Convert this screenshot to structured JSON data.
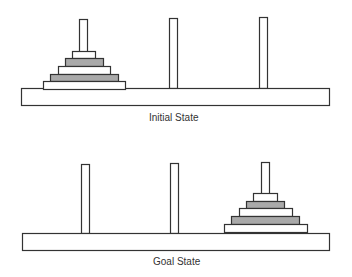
{
  "diagram": {
    "colors": {
      "stroke": "#333333",
      "disk_white": "#ffffff",
      "disk_gray": "#a9a9a9",
      "background": "#ffffff"
    },
    "panels": [
      {
        "caption": "Initial State",
        "base": {
          "x": 21,
          "y": 88,
          "w": 308,
          "h": 17
        },
        "pegs": [
          {
            "x": 79,
            "top": 19
          },
          {
            "x": 169,
            "top": 18
          },
          {
            "x": 259,
            "top": 17
          }
        ],
        "disks": [
          {
            "x": 72,
            "y": 51,
            "w": 23,
            "h": 7,
            "shade": "white"
          },
          {
            "x": 65,
            "y": 58,
            "w": 38,
            "h": 8,
            "shade": "gray"
          },
          {
            "x": 58,
            "y": 66,
            "w": 52,
            "h": 8,
            "shade": "white"
          },
          {
            "x": 50,
            "y": 74,
            "w": 68,
            "h": 7,
            "shade": "gray"
          },
          {
            "x": 43,
            "y": 81,
            "w": 82,
            "h": 8,
            "shade": "white"
          }
        ]
      },
      {
        "caption": "Goal State",
        "base": {
          "x": 22,
          "y": 233,
          "w": 307,
          "h": 17
        },
        "pegs": [
          {
            "x": 81,
            "top": 164
          },
          {
            "x": 170,
            "top": 163
          },
          {
            "x": 261,
            "top": 162
          }
        ],
        "disks": [
          {
            "x": 253,
            "y": 193,
            "w": 24,
            "h": 8,
            "shade": "white"
          },
          {
            "x": 246,
            "y": 201,
            "w": 38,
            "h": 7,
            "shade": "gray"
          },
          {
            "x": 239,
            "y": 208,
            "w": 53,
            "h": 8,
            "shade": "white"
          },
          {
            "x": 231,
            "y": 216,
            "w": 68,
            "h": 8,
            "shade": "gray"
          },
          {
            "x": 224,
            "y": 224,
            "w": 83,
            "h": 8,
            "shade": "white"
          }
        ]
      }
    ]
  }
}
